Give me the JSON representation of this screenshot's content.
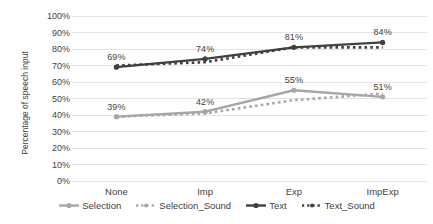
{
  "chart_data": {
    "type": "line",
    "title": "",
    "subtitle": "",
    "xlabel": "",
    "ylabel": "Percentage of speech input",
    "categories": [
      "None",
      "Imp",
      "Exp",
      "ImpExp"
    ],
    "ylim": [
      0,
      100
    ],
    "ytick_labels": [
      "0%",
      "10%",
      "20%",
      "30%",
      "40%",
      "50%",
      "60%",
      "70%",
      "80%",
      "90%",
      "100%"
    ],
    "ytick_values": [
      0,
      10,
      20,
      30,
      40,
      50,
      60,
      70,
      80,
      90,
      100
    ],
    "grid": true,
    "grid_axis": "y",
    "legend_position": "bottom",
    "value_suffix": "%",
    "series": [
      {
        "name": "Selection",
        "values": [
          39,
          42,
          55,
          51
        ],
        "color": "#a6a6a6",
        "style": "solid",
        "labels": [
          "39%",
          "42%",
          "55%",
          "51%"
        ],
        "labels_shown": true
      },
      {
        "name": "Selection_Sound",
        "values": [
          39,
          41,
          49,
          53
        ],
        "color": "#a6a6a6",
        "style": "dotted",
        "labels": [
          "",
          "",
          "",
          ""
        ],
        "labels_shown": false
      },
      {
        "name": "Text",
        "values": [
          69,
          74,
          81,
          84
        ],
        "color": "#404040",
        "style": "solid",
        "labels": [
          "69%",
          "74%",
          "81%",
          "84%"
        ],
        "labels_shown": true
      },
      {
        "name": "Text_Sound",
        "values": [
          70,
          72,
          81,
          81
        ],
        "color": "#404040",
        "style": "dotted",
        "labels": [
          "",
          "",
          "",
          ""
        ],
        "labels_shown": false
      }
    ],
    "annotations": [
      {
        "text": "39%",
        "series": "Selection",
        "category": "None"
      },
      {
        "text": "42%",
        "series": "Selection",
        "category": "Imp"
      },
      {
        "text": "55%",
        "series": "Selection",
        "category": "Exp"
      },
      {
        "text": "51%",
        "series": "Selection",
        "category": "ImpExp"
      },
      {
        "text": "69%",
        "series": "Text",
        "category": "None"
      },
      {
        "text": "74%",
        "series": "Text",
        "category": "Imp"
      },
      {
        "text": "81%",
        "series": "Text",
        "category": "Exp"
      },
      {
        "text": "84%",
        "series": "Text",
        "category": "ImpExp"
      }
    ],
    "colors": {
      "background": "#ffffff",
      "gridline": "#e4e4e4",
      "text": "#3f3f3f",
      "selection": "#a6a6a6",
      "text_series": "#404040"
    }
  }
}
